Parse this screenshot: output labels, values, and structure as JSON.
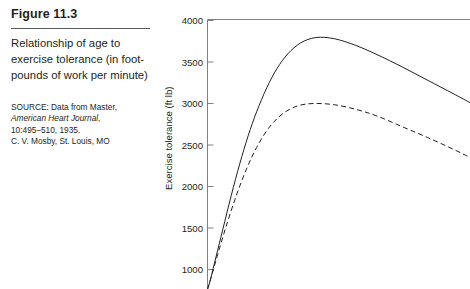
{
  "caption": {
    "figure_number": "Figure 11.3",
    "description": "Relationship of age to exercise tolerance (in foot-pounds of work per minute)",
    "source_prefix": "SOURCE: Data from Master,",
    "source_journal": "American Heart Journal,",
    "source_volume": "10:495–510, 1935.",
    "source_publisher": "C. V. Mosby, St. Louis, MO"
  },
  "chart_data": {
    "type": "line",
    "title": "Relationship of age to exercise tolerance (in foot-pounds of work per minute)",
    "xlabel": "",
    "ylabel": "Exercise tolerance (ft lb)",
    "ylim": [
      750,
      4000
    ],
    "yticks": [
      1000,
      1500,
      2000,
      2500,
      3000,
      3500,
      4000
    ],
    "ytick_labels": [
      "1000",
      "1500",
      "2000",
      "2500",
      "3000",
      "3500",
      "4000"
    ],
    "grid": false,
    "legend": "none",
    "axis_frame": "top-left",
    "x_axis_visible": false,
    "series": [
      {
        "name": "Men",
        "style": "solid",
        "peak_value": 3800,
        "right_edge_value": 3000,
        "x": [
          0,
          4,
          10,
          18,
          28,
          38,
          48,
          58,
          70,
          82,
          95,
          110,
          128,
          150,
          175,
          200,
          230,
          260,
          290,
          310
        ],
        "y": [
          760,
          900,
          1150,
          1480,
          1890,
          2270,
          2610,
          2900,
          3190,
          3420,
          3600,
          3730,
          3795,
          3780,
          3700,
          3590,
          3440,
          3280,
          3120,
          3010
        ]
      },
      {
        "name": "Women",
        "style": "dashed",
        "peak_value": 3000,
        "right_edge_value": 2320,
        "x": [
          0,
          5,
          12,
          22,
          34,
          46,
          58,
          72,
          88,
          106,
          126,
          150,
          175,
          200,
          230,
          260,
          290,
          310
        ],
        "y": [
          760,
          930,
          1180,
          1520,
          1890,
          2210,
          2470,
          2700,
          2870,
          2970,
          3000,
          2985,
          2930,
          2850,
          2720,
          2590,
          2450,
          2350
        ]
      }
    ]
  }
}
